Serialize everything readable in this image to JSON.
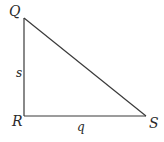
{
  "diagram": {
    "type": "right-triangle",
    "stroke_color": "#3a3a3a",
    "vertices": [
      {
        "name": "Q",
        "x": 24,
        "y": 18,
        "label_x": 9,
        "label_y": 16
      },
      {
        "name": "R",
        "x": 24,
        "y": 116,
        "label_x": 12,
        "label_y": 126
      },
      {
        "name": "S",
        "x": 146,
        "y": 116,
        "label_x": 149,
        "label_y": 128
      }
    ],
    "sides": [
      {
        "name": "s",
        "from": "Q",
        "to": "R",
        "label_x": 16,
        "label_y": 77
      },
      {
        "name": "q",
        "from": "R",
        "to": "S",
        "label_x": 77,
        "label_y": 131
      },
      {
        "name": "",
        "from": "Q",
        "to": "S"
      }
    ],
    "right_angle_at": "R"
  },
  "labels": {
    "Q": "Q",
    "R": "R",
    "S": "S",
    "s": "s",
    "q": "q"
  }
}
